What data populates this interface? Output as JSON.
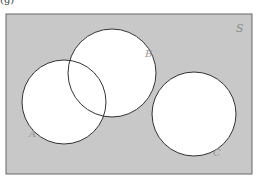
{
  "figure": {
    "label": "(g)",
    "universe_label": "S",
    "sets": [
      {
        "name": "A",
        "cx": 64,
        "cy": 102,
        "r": 42,
        "label_x": 31,
        "label_y": 136
      },
      {
        "name": "B",
        "cx": 112,
        "cy": 73,
        "r": 44,
        "label_x": 148,
        "label_y": 56
      },
      {
        "name": "C",
        "cx": 194,
        "cy": 114,
        "r": 42,
        "label_x": 217,
        "label_y": 155
      }
    ],
    "colors": {
      "shaded": "#c8c8c8",
      "circle_fill": "#ffffff",
      "stroke": "#333333",
      "label": "#888888"
    }
  }
}
